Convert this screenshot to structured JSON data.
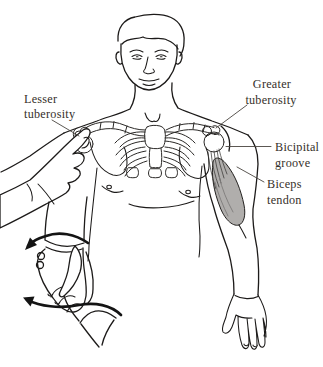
{
  "figure": {
    "colors": {
      "background": "#ffffff",
      "line": "#1d1b1a",
      "muscle_fill": "#b0aeac",
      "label_text": "#35302a",
      "arrow": "#141414"
    },
    "labels": {
      "lesser_tuberosity": {
        "line1": "Lesser",
        "line2": "tuberosity"
      },
      "greater_tuberosity": {
        "line1": "Greater",
        "line2": "tuberosity"
      },
      "bicipital_groove": {
        "line1": "Bicipital",
        "line2": "groove"
      },
      "biceps_tendon": {
        "line1": "Biceps",
        "line2": "tendon"
      }
    }
  }
}
